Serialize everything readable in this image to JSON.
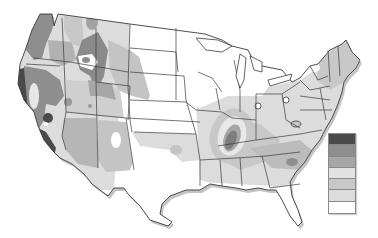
{
  "map": {
    "subject": "Contiguous United States shaded contour map",
    "style": "grayscale",
    "outline_color": "#3a3a3a",
    "shadow_color": "#b8b8b8"
  },
  "legend": {
    "position": "right, lower-middle",
    "swatches": [
      {
        "level": 7,
        "color": "#4a4a4a"
      },
      {
        "level": 6,
        "color": "#8e8e8e"
      },
      {
        "level": 5,
        "color": "#a6a6a6"
      },
      {
        "level": 4,
        "color": "#e2e2e2"
      },
      {
        "level": 3,
        "color": "#c8c8c8"
      },
      {
        "level": 2,
        "color": "#dcdcdc"
      },
      {
        "level": 1,
        "color": "#ffffff"
      }
    ]
  },
  "shades": {
    "darkest": "#4a4a4a",
    "dark": "#7e7e7e",
    "medium": "#a6a6a6",
    "medium_light": "#c2c2c2",
    "light": "#d9d9d9",
    "lightest": "#ececec",
    "white": "#ffffff"
  }
}
